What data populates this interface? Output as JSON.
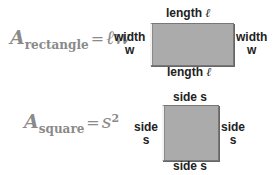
{
  "rectangle": {
    "formula": {
      "A": "A",
      "subscript": "rectangle",
      "equals": "=",
      "rhs": "ℓw"
    },
    "top_label": {
      "text": "length",
      "symbol": "ℓ"
    },
    "bottom_label": {
      "text": "length",
      "symbol": "ℓ"
    },
    "left_label": {
      "line1": "width",
      "line2": "w"
    },
    "right_label": {
      "line1": "width",
      "line2": "w"
    },
    "fill_color": "#ababab"
  },
  "square": {
    "formula": {
      "A": "A",
      "subscript": "square",
      "equals": "=",
      "rhs": "s",
      "exponent": "2"
    },
    "top_label": "side s",
    "bottom_label": "side s",
    "left_label": {
      "line1": "side",
      "line2": "s"
    },
    "right_label": {
      "line1": "side",
      "line2": "s"
    },
    "fill_color": "#ababab"
  }
}
